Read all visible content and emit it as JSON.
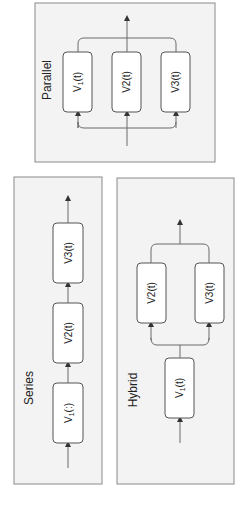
{
  "diagram": {
    "orientation": "rotated-90-ccw",
    "panels": {
      "parallel": {
        "title": "Parallel",
        "blocks": [
          {
            "base": "V",
            "sub": "1",
            "suffix": "(t)"
          },
          {
            "base": "V2(t)",
            "sub": "",
            "suffix": ""
          },
          {
            "base": "V3(t)",
            "sub": "",
            "suffix": ""
          }
        ]
      },
      "series": {
        "title": "Series",
        "blocks": [
          {
            "base": "V",
            "sub": "1",
            "suffix": "(:)"
          },
          {
            "base": "V2(t)",
            "sub": "",
            "suffix": ""
          },
          {
            "base": "V3(t)",
            "sub": "",
            "suffix": ""
          }
        ]
      },
      "hybrid": {
        "title": "Hybrid",
        "blocks": [
          {
            "base": "V",
            "sub": "1",
            "suffix": "(t)"
          },
          {
            "base": "V2(t)",
            "sub": "",
            "suffix": ""
          },
          {
            "base": "V3(t)",
            "sub": "",
            "suffix": ""
          }
        ]
      }
    },
    "colors": {
      "panel_fill": "#f3f3f3",
      "panel_border": "#8a8a8a",
      "box_fill": "#ffffff",
      "box_border": "#555555",
      "wire": "#6a6a6a",
      "text": "#222222"
    }
  }
}
